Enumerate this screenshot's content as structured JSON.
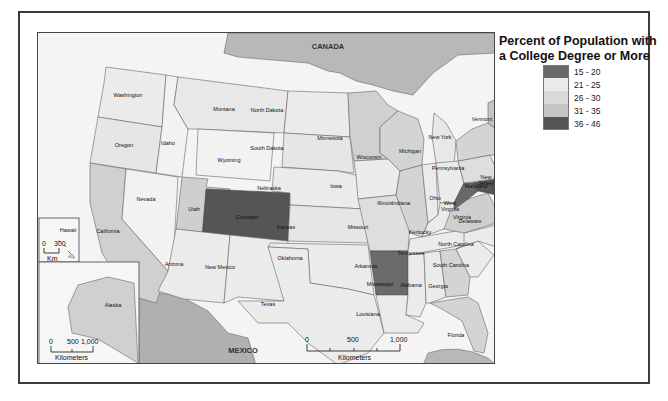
{
  "legend": {
    "title_line1": "Percent of Population with",
    "title_line2": "a College Degree or More",
    "classes": [
      {
        "label": "15 - 20",
        "color": "#6a6a6a"
      },
      {
        "label": "21 - 25",
        "color": "#ebebeb"
      },
      {
        "label": "26 - 30",
        "color": "#d9d9d9"
      },
      {
        "label": "31 - 35",
        "color": "#c4c4c4"
      },
      {
        "label": "36 - 46",
        "color": "#555555"
      }
    ]
  },
  "map": {
    "neighbors": {
      "canada": "CANADA",
      "mexico": "MEXICO"
    },
    "states": {
      "washington": "Washington",
      "oregon": "Oregon",
      "california": "California",
      "idaho": "Idaho",
      "nevada": "Nevada",
      "montana": "Montana",
      "wyoming": "Wyoming",
      "utah": "Utah",
      "colorado": "Colorado",
      "arizona": "Arizona",
      "new_mexico": "New Mexico",
      "north_dakota": "North Dakota",
      "south_dakota": "South Dakota",
      "nebraska": "Nebraska",
      "kansas": "Kansas",
      "oklahoma": "Oklahoma",
      "texas": "Texas",
      "minnesota": "Minnesota",
      "iowa": "Iowa",
      "missouri": "Missouri",
      "arkansas": "Arkansas",
      "louisiana": "Louisiana",
      "wisconsin": "Wisconsin",
      "illinois": "Illinois",
      "michigan": "Michigan",
      "indiana": "Indiana",
      "ohio": "Ohio",
      "kentucky": "Kentucky",
      "tennessee": "Tennessee",
      "mississippi": "Mississippi",
      "alabama": "Alabama",
      "georgia": "Georgia",
      "florida": "Florida",
      "south_carolina": "South Carolina",
      "north_carolina": "North Carolina",
      "virginia": "Virginia",
      "west_virginia_1": "West",
      "west_virginia_2": "Virginia",
      "pennsylvania": "Pennsylvania",
      "new_york": "New York",
      "maryland": "Maryland",
      "delaware": "Delaware",
      "new_jersey_1": "New",
      "new_jersey_2": "Jersey",
      "vermont": "Vermont",
      "new_hampshire_1": "New",
      "new_hampshire_2": "Hampshire",
      "maine": "Maine",
      "massachusetts": "Massachusetts",
      "connecticut": "Connecticut",
      "rhode_island_1": "Rhode",
      "rhode_island_2": "Island",
      "hawaii": "Hawaii",
      "alaska": "Alaska"
    },
    "scale_main": {
      "ticks": [
        "0",
        "500",
        "1,000"
      ],
      "unit": "Kilometers"
    },
    "scale_hawaii": {
      "ticks": [
        "0",
        "300"
      ],
      "unit": "Km"
    },
    "scale_alaska": {
      "ticks": [
        "0",
        "500",
        "1,000"
      ],
      "unit": "Kilometers"
    }
  }
}
